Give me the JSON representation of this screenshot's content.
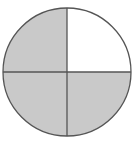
{
  "diagram": {
    "type": "fraction-circle",
    "total_parts": 4,
    "shaded_parts": 3,
    "fraction_shaded": "3/4",
    "center": {
      "x": 67,
      "y": 72
    },
    "radius": 64,
    "quadrants": [
      {
        "position": "top-left",
        "shaded": true
      },
      {
        "position": "top-right",
        "shaded": false
      },
      {
        "position": "bottom-left",
        "shaded": true
      },
      {
        "position": "bottom-right",
        "shaded": true
      }
    ],
    "colors": {
      "shaded_fill": "#c9c9c9",
      "unshaded_fill": "#ffffff",
      "stroke": "#555555",
      "background": "#ffffff"
    }
  }
}
